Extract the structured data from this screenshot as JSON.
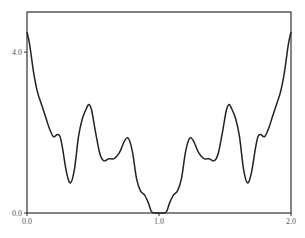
{
  "chart_data": {
    "type": "line",
    "title": "",
    "xlabel": "",
    "ylabel": "",
    "xlim": [
      0.0,
      2.0
    ],
    "ylim": [
      0.0,
      5.0
    ],
    "grid": false,
    "legend": null,
    "x_ticks": [
      {
        "value": 0.0,
        "label": "0.0"
      },
      {
        "value": 1.0,
        "label": "1.0"
      },
      {
        "value": 2.0,
        "label": "2.0"
      }
    ],
    "y_ticks": [
      {
        "value": 0.0,
        "label": "0.0"
      },
      {
        "value": 4.0,
        "label": "4.0"
      }
    ],
    "series": [
      {
        "name": "curve",
        "color": "#222222",
        "x": [
          0.0,
          0.02,
          0.05,
          0.08,
          0.11,
          0.14,
          0.17,
          0.2,
          0.23,
          0.25,
          0.27,
          0.3,
          0.33,
          0.36,
          0.39,
          0.42,
          0.45,
          0.47,
          0.49,
          0.52,
          0.55,
          0.58,
          0.62,
          0.66,
          0.7,
          0.74,
          0.77,
          0.8,
          0.83,
          0.86,
          0.89,
          0.92,
          0.94,
          0.96,
          1.0,
          1.04,
          1.06,
          1.08,
          1.11,
          1.14,
          1.17,
          1.2,
          1.23,
          1.26,
          1.3,
          1.34,
          1.38,
          1.42,
          1.45,
          1.48,
          1.51,
          1.53,
          1.55,
          1.58,
          1.61,
          1.64,
          1.67,
          1.7,
          1.73,
          1.75,
          1.77,
          1.8,
          1.83,
          1.86,
          1.89,
          1.92,
          1.95,
          1.98,
          2.0
        ],
        "y": [
          4.5,
          4.2,
          3.5,
          3.0,
          2.7,
          2.4,
          2.1,
          1.9,
          1.95,
          1.9,
          1.6,
          1.0,
          0.75,
          1.1,
          1.9,
          2.35,
          2.6,
          2.7,
          2.55,
          2.0,
          1.5,
          1.3,
          1.35,
          1.35,
          1.5,
          1.8,
          1.85,
          1.5,
          0.85,
          0.55,
          0.45,
          0.25,
          0.05,
          0.0,
          0.0,
          0.0,
          0.05,
          0.25,
          0.45,
          0.55,
          0.85,
          1.5,
          1.85,
          1.8,
          1.5,
          1.35,
          1.35,
          1.3,
          1.5,
          2.0,
          2.55,
          2.7,
          2.6,
          2.35,
          1.9,
          1.1,
          0.75,
          1.0,
          1.6,
          1.9,
          1.95,
          1.9,
          2.1,
          2.4,
          2.7,
          3.0,
          3.5,
          4.2,
          4.5
        ]
      }
    ]
  }
}
